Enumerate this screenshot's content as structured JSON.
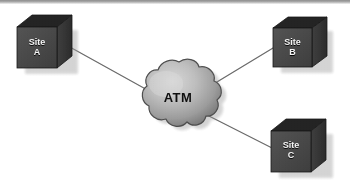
{
  "diagram": {
    "type": "network-topology",
    "background_color": "#ffffff",
    "scan_band_color": "#a9a9a9",
    "cloud": {
      "id": "atm-cloud",
      "label": "ATM",
      "shape": "cloud",
      "text_color": "#111111",
      "fill_light": "#c9c9c9",
      "fill_dark": "#6f6f6f",
      "outline_color": "#4a4a4a",
      "center_x": 178,
      "center_y": 98
    },
    "nodes": [
      {
        "id": "site-a",
        "label_line1": "Site",
        "label_line2": "A",
        "label": "Site A",
        "shape": "cube",
        "position": "top-left",
        "front_fill": "#4a4a4a",
        "top_fill": "#2b2b2b",
        "side_fill": "#3a3a3a",
        "shadow_fill": "#a8a8a8",
        "text_color": "#f2f2f2",
        "x": 17,
        "y": 18,
        "width": 52,
        "height": 48
      },
      {
        "id": "site-b",
        "label_line1": "Site",
        "label_line2": "B",
        "label": "Site B",
        "shape": "cube",
        "position": "top-right",
        "front_fill": "#4a4a4a",
        "top_fill": "#2b2b2b",
        "side_fill": "#3a3a3a",
        "shadow_fill": "#a8a8a8",
        "text_color": "#f2f2f2",
        "x": 272,
        "y": 20,
        "width": 50,
        "height": 46
      },
      {
        "id": "site-c",
        "label_line1": "Site",
        "label_line2": "C",
        "label": "Site C",
        "shape": "cube",
        "position": "bottom-right",
        "front_fill": "#4a4a4a",
        "top_fill": "#2b2b2b",
        "side_fill": "#3a3a3a",
        "shadow_fill": "#a8a8a8",
        "text_color": "#f2f2f2",
        "x": 270,
        "y": 122,
        "width": 52,
        "height": 48
      }
    ],
    "links": [
      {
        "id": "link-site-a-atm",
        "from": "site-a",
        "to": "atm-cloud",
        "x1": 68,
        "y1": 46,
        "x2": 151,
        "y2": 92,
        "color": "#6b6b6b",
        "width": 1.3
      },
      {
        "id": "link-atm-site-b",
        "from": "atm-cloud",
        "to": "site-b",
        "x1": 207,
        "y1": 88,
        "x2": 276,
        "y2": 46,
        "color": "#6b6b6b",
        "width": 1.3
      },
      {
        "id": "link-atm-site-c",
        "from": "atm-cloud",
        "to": "site-c",
        "x1": 203,
        "y1": 113,
        "x2": 275,
        "y2": 150,
        "color": "#6b6b6b",
        "width": 1.3
      }
    ]
  }
}
